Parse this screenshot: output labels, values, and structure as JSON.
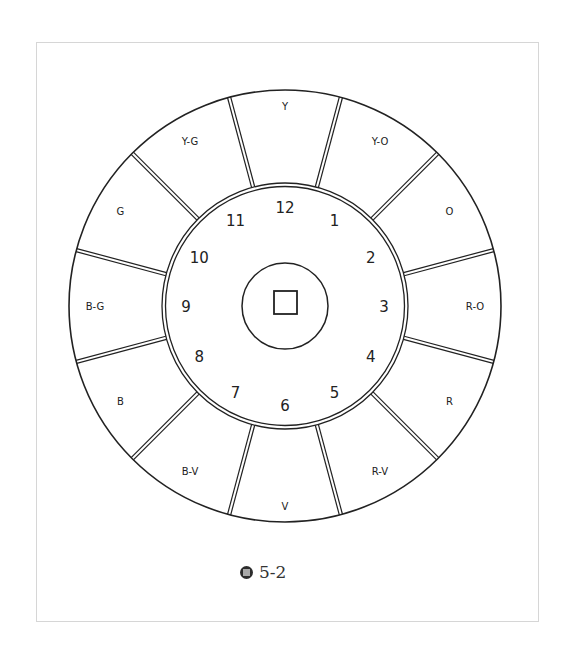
{
  "figure": {
    "caption_label": "5-2",
    "caption_icon": "figure-icon",
    "center": {
      "x": 285,
      "y": 306
    },
    "radii": {
      "outer": 216,
      "ring": 121,
      "hub": 43
    },
    "hub_square": {
      "x": 274,
      "y": 291,
      "size": 23
    },
    "colors": {
      "line": "#222222",
      "frame": "#d6d6d6",
      "background": "#ffffff"
    }
  },
  "outer_segments": [
    {
      "label": "Y",
      "angle": 90
    },
    {
      "label": "Y-O",
      "angle": 60
    },
    {
      "label": "O",
      "angle": 30
    },
    {
      "label": "R-O",
      "angle": 0
    },
    {
      "label": "R",
      "angle": -30
    },
    {
      "label": "R-V",
      "angle": -60
    },
    {
      "label": "V",
      "angle": -90
    },
    {
      "label": "B-V",
      "angle": -120
    },
    {
      "label": "B",
      "angle": -150
    },
    {
      "label": "B-G",
      "angle": 180
    },
    {
      "label": "G",
      "angle": 150
    },
    {
      "label": "Y-G",
      "angle": 120
    }
  ],
  "clock_numbers": [
    "12",
    "1",
    "2",
    "3",
    "4",
    "5",
    "6",
    "7",
    "8",
    "9",
    "10",
    "11"
  ]
}
